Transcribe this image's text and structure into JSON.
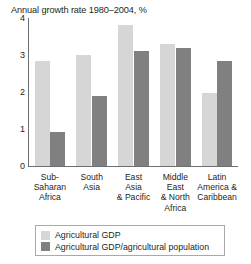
{
  "chart_data": {
    "type": "bar",
    "title": "Annual growth rate 1980–2004, %",
    "xlabel": "",
    "ylabel": "",
    "ylim": [
      0,
      4
    ],
    "yticks": [
      0,
      1,
      2,
      3,
      4
    ],
    "grid": false,
    "legend_position": "bottom",
    "categories": [
      "Sub-\nSaharan\nAfrica",
      "South\nAsia",
      "East\nAsia\n& Pacific",
      "Middle\nEast\n& North\nAfrica",
      "Latin\nAmerica &\nCaribbean"
    ],
    "category_lines": [
      [
        "Sub-",
        "Saharan",
        "Africa"
      ],
      [
        "South",
        "Asia"
      ],
      [
        "East",
        "Asia",
        "& Pacific"
      ],
      [
        "Middle",
        "East",
        "& North",
        "Africa"
      ],
      [
        "Latin",
        "America &",
        "Caribbean"
      ]
    ],
    "series": [
      {
        "name": "Agricultural GDP",
        "color": "#d6d6d6",
        "values": [
          2.85,
          3.0,
          3.8,
          3.3,
          1.97
        ]
      },
      {
        "name": "Agricultural GDP/agricultural population",
        "color": "#808080",
        "values": [
          0.92,
          1.9,
          3.12,
          3.18,
          2.85
        ]
      }
    ]
  },
  "legend": {
    "items": [
      {
        "label": "Agricultural GDP",
        "color": "#d6d6d6"
      },
      {
        "label": "Agricultural GDP/agricultural population",
        "color": "#808080"
      }
    ]
  },
  "axis": {
    "tick_labels": [
      "0",
      "1",
      "2",
      "3",
      "4"
    ]
  }
}
